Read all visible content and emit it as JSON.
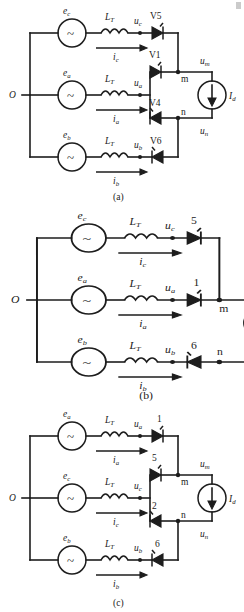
{
  "figure": {
    "type": "circuit-diagram",
    "panel_count": 3
  },
  "common": {
    "origin_node": "O",
    "inductor_label": "L",
    "inductor_sub": "T",
    "current_source_label": "I",
    "current_source_sub": "d",
    "node_m": "m",
    "node_n": "n",
    "voltage_m": "u",
    "voltage_m_sub": "m",
    "voltage_n": "u",
    "voltage_n_sub": "n",
    "source_symbol": "~"
  },
  "panels": [
    {
      "id": "a",
      "caption": "(a)",
      "phases": [
        {
          "emf": "e",
          "emf_sub": "c",
          "current": "i",
          "current_sub": "c",
          "volt": "u",
          "volt_sub": "c"
        },
        {
          "emf": "e",
          "emf_sub": "a",
          "current": "i",
          "current_sub": "a",
          "volt": "u",
          "volt_sub": "a"
        },
        {
          "emf": "e",
          "emf_sub": "b",
          "current": "i",
          "current_sub": "b",
          "volt": "u",
          "volt_sub": "b"
        }
      ],
      "devices": [
        {
          "name": "V5",
          "direction": "right",
          "row": "top"
        },
        {
          "name": "V1",
          "direction": "right",
          "row": "mid-upper"
        },
        {
          "name": "V4",
          "direction": "left",
          "row": "mid-lower"
        },
        {
          "name": "V6",
          "direction": "left",
          "row": "bottom"
        }
      ]
    },
    {
      "id": "b",
      "caption": "(b)",
      "phases": [
        {
          "emf": "e",
          "emf_sub": "c",
          "current": "i",
          "current_sub": "c",
          "volt": "u",
          "volt_sub": "c"
        },
        {
          "emf": "e",
          "emf_sub": "a",
          "current": "i",
          "current_sub": "a",
          "volt": "u",
          "volt_sub": "a"
        },
        {
          "emf": "e",
          "emf_sub": "b",
          "current": "i",
          "current_sub": "b",
          "volt": "u",
          "volt_sub": "b"
        }
      ],
      "devices": [
        {
          "name": "5",
          "direction": "right",
          "row": "top"
        },
        {
          "name": "1",
          "direction": "right",
          "row": "mid"
        },
        {
          "name": "6",
          "direction": "left",
          "row": "bottom"
        }
      ]
    },
    {
      "id": "c",
      "caption": "(c)",
      "phases": [
        {
          "emf": "e",
          "emf_sub": "a",
          "current": "i",
          "current_sub": "a",
          "volt": "u",
          "volt_sub": "a"
        },
        {
          "emf": "e",
          "emf_sub": "c",
          "current": "i",
          "current_sub": "c",
          "volt": "u",
          "volt_sub": "c"
        },
        {
          "emf": "e",
          "emf_sub": "b",
          "current": "i",
          "current_sub": "b",
          "volt": "u",
          "volt_sub": "b"
        }
      ],
      "devices": [
        {
          "name": "1",
          "direction": "right",
          "row": "top"
        },
        {
          "name": "5",
          "direction": "right",
          "row": "mid-upper"
        },
        {
          "name": "2",
          "direction": "left",
          "row": "mid-lower"
        },
        {
          "name": "6",
          "direction": "left",
          "row": "bottom"
        }
      ]
    }
  ],
  "colors": {
    "ink": "#1d1d1d",
    "paper": "#ffffff"
  }
}
